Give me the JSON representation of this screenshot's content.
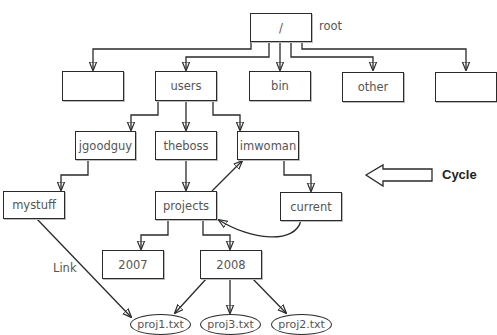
{
  "diagram": {
    "type": "directory-tree-with-cycle",
    "root": {
      "label": "/",
      "annotation": "root"
    },
    "level1": [
      {
        "id": "unnamed-left",
        "label": ""
      },
      {
        "id": "users",
        "label": "users"
      },
      {
        "id": "bin",
        "label": "bin"
      },
      {
        "id": "other",
        "label": "other"
      },
      {
        "id": "unnamed-right",
        "label": ""
      }
    ],
    "level2": [
      {
        "id": "jgoodguy",
        "label": "jgoodguy"
      },
      {
        "id": "theboss",
        "label": "theboss"
      },
      {
        "id": "imwoman",
        "label": "imwoman"
      }
    ],
    "level3": [
      {
        "id": "mystuff",
        "label": "mystuff"
      },
      {
        "id": "projects",
        "label": "projects"
      },
      {
        "id": "current",
        "label": "current"
      }
    ],
    "level4": [
      {
        "id": "2007",
        "label": "2007"
      },
      {
        "id": "2008",
        "label": "2008"
      }
    ],
    "files": [
      {
        "id": "proj1",
        "label": "proj1.txt"
      },
      {
        "id": "proj3",
        "label": "proj3.txt"
      },
      {
        "id": "proj2",
        "label": "proj2.txt"
      }
    ],
    "annotations": {
      "link_label": "Link",
      "cycle_label": "Cycle"
    },
    "edges": [
      [
        "/",
        "unnamed-left"
      ],
      [
        "/",
        "users"
      ],
      [
        "/",
        "bin"
      ],
      [
        "/",
        "other"
      ],
      [
        "/",
        "unnamed-right"
      ],
      [
        "users",
        "jgoodguy"
      ],
      [
        "users",
        "theboss"
      ],
      [
        "users",
        "imwoman"
      ],
      [
        "jgoodguy",
        "mystuff"
      ],
      [
        "theboss",
        "projects"
      ],
      [
        "imwoman",
        "current"
      ],
      [
        "projects",
        "imwoman"
      ],
      [
        "current",
        "projects"
      ],
      [
        "projects",
        "2007"
      ],
      [
        "projects",
        "2008"
      ],
      [
        "2008",
        "proj1.txt"
      ],
      [
        "2008",
        "proj3.txt"
      ],
      [
        "2008",
        "proj2.txt"
      ],
      [
        "mystuff",
        "proj1.txt"
      ]
    ]
  }
}
